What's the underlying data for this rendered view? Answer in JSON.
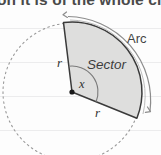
{
  "page": {
    "width": 161,
    "height": 155,
    "background_color": "#fdfdfd",
    "ruled_line_color": "#ececed"
  },
  "heading": {
    "text": "on it is of the whole cir",
    "note": "partially cropped text line at very top of image"
  },
  "figure": {
    "colors": {
      "sector_fill": "#dededd",
      "sector_stroke": "#3a3a3a",
      "dashed_circle": "#9a9a9a",
      "arc_measure_arrow": "#8c8c8c",
      "angle_arc": "#7a7a7a",
      "vertex_dot": "#1a1a1a"
    },
    "geometry": {
      "center_x": 72,
      "center_y": 92,
      "radius": 70,
      "start_angle_deg": -97,
      "end_angle_deg": 22,
      "angle_marker_radius": 26
    },
    "labels": [
      {
        "id": "arc",
        "text": "Arc",
        "x": 127,
        "y": 31
      },
      {
        "id": "sector",
        "text": "Sector",
        "x": 87,
        "y": 57
      },
      {
        "id": "radius_left",
        "text": "r",
        "x": 57,
        "y": 55
      },
      {
        "id": "radius_bottom",
        "text": "r",
        "x": 95,
        "y": 105
      },
      {
        "id": "angle",
        "text": "x",
        "x": 79,
        "y": 77
      }
    ]
  }
}
